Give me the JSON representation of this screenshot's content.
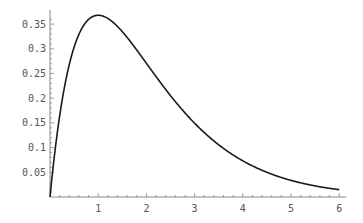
{
  "chart_data": {
    "type": "line",
    "title": "",
    "xlabel": "",
    "ylabel": "",
    "function": "x*exp(-x)",
    "xlim": [
      0,
      6
    ],
    "ylim": [
      0,
      0.37
    ],
    "grid": false,
    "legend": null,
    "x_ticks": [
      "1",
      "2",
      "3",
      "4",
      "5",
      "6"
    ],
    "y_ticks": [
      "0.05",
      "0.1",
      "0.15",
      "0.2",
      "0.25",
      "0.3",
      "0.35"
    ],
    "series": [
      {
        "name": "f(x)",
        "x": [
          0,
          0.25,
          0.5,
          0.75,
          1,
          1.5,
          2,
          2.5,
          3,
          3.5,
          4,
          4.5,
          5,
          5.5,
          6
        ],
        "values": [
          0,
          0.195,
          0.303,
          0.354,
          0.368,
          0.335,
          0.271,
          0.205,
          0.149,
          0.106,
          0.073,
          0.05,
          0.034,
          0.022,
          0.015
        ]
      }
    ],
    "colors": {
      "line": "#1a1a1a",
      "axis": "#888888",
      "labels": "#555555"
    }
  }
}
